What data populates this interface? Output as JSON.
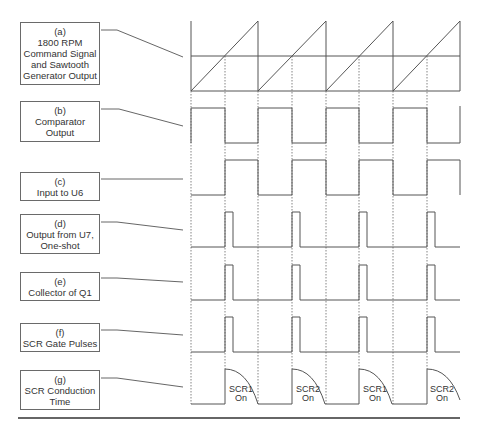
{
  "diagram": {
    "type": "timing-diagram",
    "colors": {
      "line": "#555555",
      "dotted": "#777777",
      "rule": "#333333",
      "background": "#ffffff"
    },
    "period_edges_x": [
      191,
      258,
      326,
      393,
      460
    ],
    "crossing_points_x": [
      225,
      292,
      359,
      427
    ],
    "signals": [
      {
        "id": "a",
        "tag": "(a)",
        "lines": [
          "1800 RPM",
          "Command Signal",
          "and Sawtooth",
          "Generator Output"
        ],
        "waveform": "sawtooth-with-command-level"
      },
      {
        "id": "b",
        "tag": "(b)",
        "lines": [
          "Comparator",
          "Output"
        ],
        "waveform": "square-high-first"
      },
      {
        "id": "c",
        "tag": "(c)",
        "lines": [
          "Input to U6"
        ],
        "waveform": "square-low-first"
      },
      {
        "id": "d",
        "tag": "(d)",
        "lines": [
          "Output from U7,",
          "One-shot"
        ],
        "waveform": "pulse"
      },
      {
        "id": "e",
        "tag": "(e)",
        "lines": [
          "Collector of Q1"
        ],
        "waveform": "pulse"
      },
      {
        "id": "f",
        "tag": "(f)",
        "lines": [
          "SCR Gate Pulses"
        ],
        "waveform": "pulse"
      },
      {
        "id": "g",
        "tag": "(g)",
        "lines": [
          "SCR Conduction",
          "Time"
        ],
        "waveform": "conduction-decay"
      }
    ],
    "conduction_labels": [
      {
        "line1": "SCR1",
        "line2": "On"
      },
      {
        "line1": "SCR2",
        "line2": "On"
      },
      {
        "line1": "SCR1",
        "line2": "On"
      },
      {
        "line1": "SCR2",
        "line2": "On"
      }
    ]
  }
}
